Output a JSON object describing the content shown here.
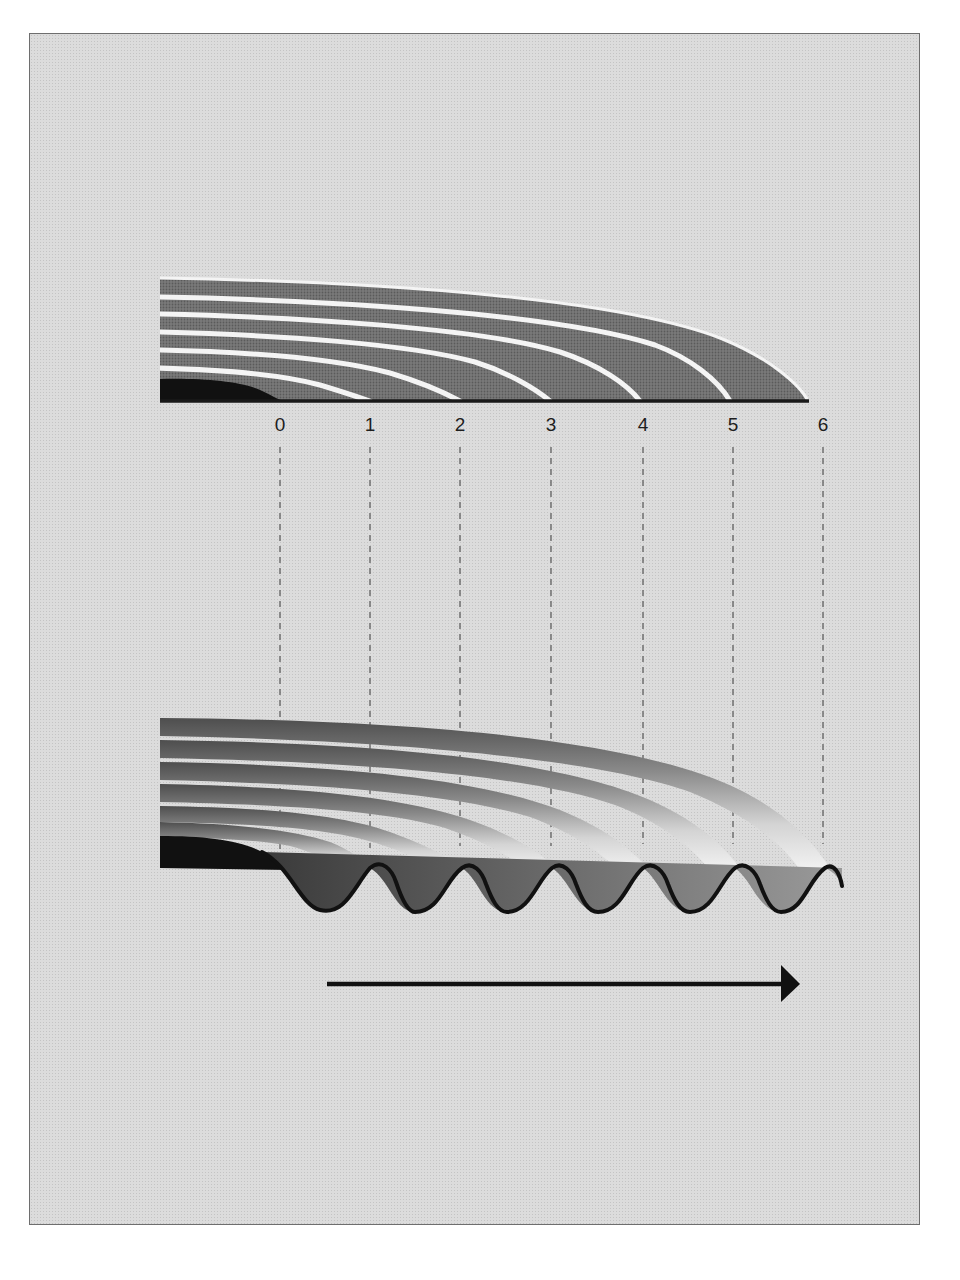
{
  "diagram": {
    "colors": {
      "background": "#dcdcdc",
      "frame_border": "#6e6e6e",
      "band_fill": "#6f6f6f",
      "band_separator": "#f4f4f4",
      "core_fill": "#111111",
      "baseline": "#1a1a1a",
      "outline": "#111111",
      "arrow": "#111111",
      "dashed": "#555555"
    },
    "top_figure": {
      "layers": 6,
      "baseline_y": 401
    },
    "positions": {
      "labels": [
        "0",
        "1",
        "2",
        "3",
        "4",
        "5",
        "6"
      ],
      "x": [
        280,
        370,
        460,
        551,
        643,
        733,
        823
      ]
    },
    "bottom_figure": {
      "corrugation_peaks": 6
    },
    "arrow": {
      "direction": "right",
      "meaning": "direction of travel"
    }
  }
}
